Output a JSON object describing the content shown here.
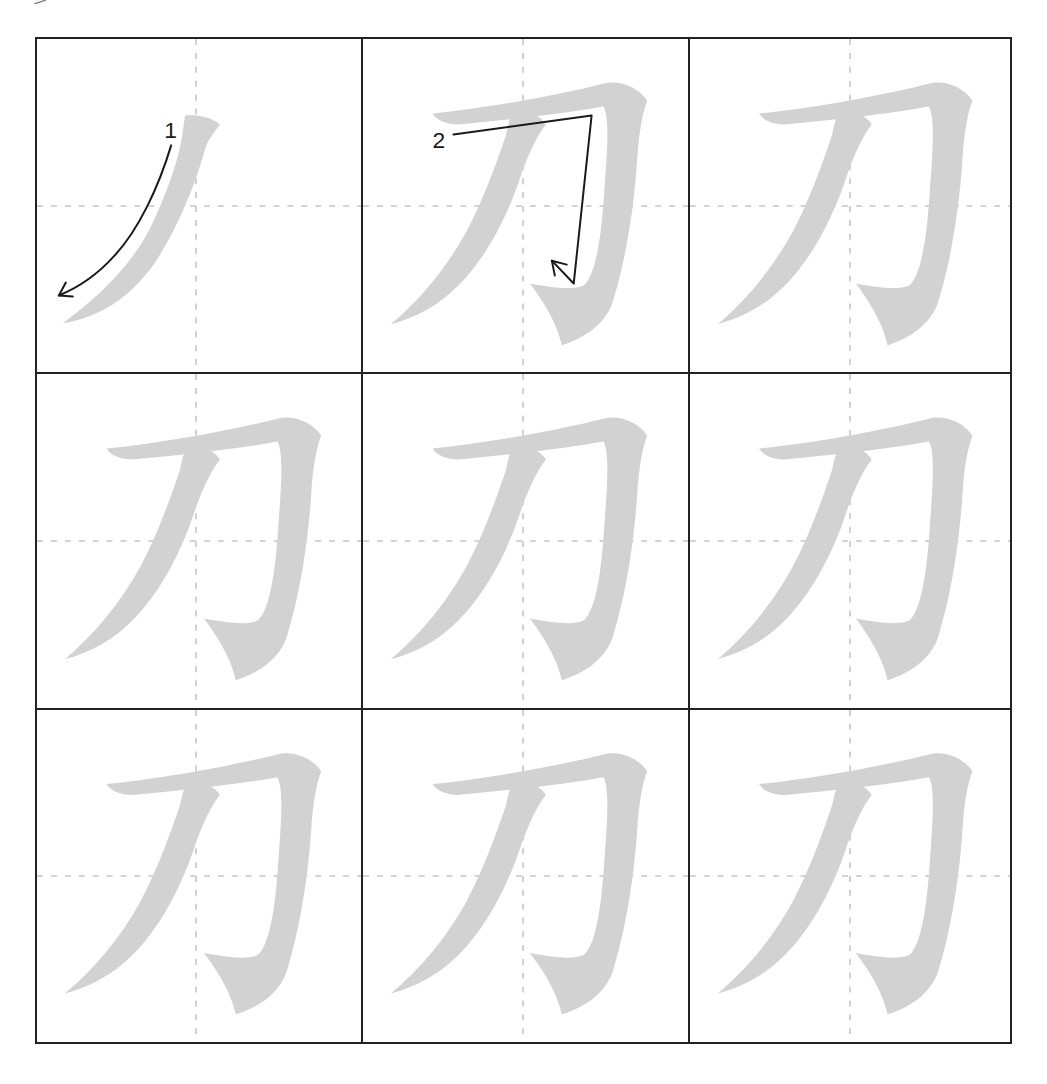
{
  "worksheet": {
    "character": "刀",
    "rows": 3,
    "columns": 3,
    "stroke_count": 2,
    "colors": {
      "border": "#222222",
      "guide": "#c6c6c6",
      "glyph": "#d2d2d2",
      "annotation": "#1a1a1a"
    },
    "cells": [
      {
        "index": 0,
        "mode": "stroke-1",
        "stroke_label": "1"
      },
      {
        "index": 1,
        "mode": "stroke-2",
        "stroke_label": "2"
      },
      {
        "index": 2,
        "mode": "full"
      },
      {
        "index": 3,
        "mode": "full"
      },
      {
        "index": 4,
        "mode": "full"
      },
      {
        "index": 5,
        "mode": "full"
      },
      {
        "index": 6,
        "mode": "full"
      },
      {
        "index": 7,
        "mode": "full"
      },
      {
        "index": 8,
        "mode": "full"
      }
    ]
  }
}
